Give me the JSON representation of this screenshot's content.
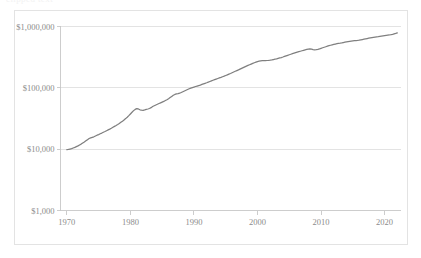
{
  "top_remnant_text": "clipped text",
  "chart_data": {
    "type": "line",
    "title": "",
    "subtitle": "",
    "xlabel": "",
    "ylabel": "",
    "yscale": "log",
    "ylim": [
      1000,
      1000000
    ],
    "xlim": [
      1969,
      2022.5
    ],
    "grid": true,
    "legend": false,
    "line_color": "#7f7f7f",
    "gridline_color": "#dcdcdc",
    "axis_color": "#c8c8c8",
    "text_color": "#8c8c8c",
    "background_color": "#ffffff",
    "y_tick_labels": [
      "$1,000,000",
      "$100,000",
      "$10,000",
      "$1,000"
    ],
    "y_tick_values": [
      1000000,
      100000,
      10000,
      1000
    ],
    "x_tick_labels": [
      "1970",
      "1980",
      "1990",
      "2000",
      "2010",
      "2020"
    ],
    "x_tick_values": [
      1970,
      1980,
      1990,
      2000,
      2010,
      2020
    ],
    "series": [
      {
        "name": "value",
        "x": [
          1970.0,
          1970.25,
          1970.5,
          1970.75,
          1971.0,
          1971.25,
          1971.5,
          1971.75,
          1972.0,
          1972.25,
          1972.5,
          1972.75,
          1973.0,
          1973.25,
          1973.5,
          1973.75,
          1974.0,
          1974.25,
          1974.5,
          1974.75,
          1975.0,
          1975.25,
          1975.5,
          1975.75,
          1976.0,
          1976.25,
          1976.5,
          1976.75,
          1977.0,
          1977.25,
          1977.5,
          1977.75,
          1978.0,
          1978.25,
          1978.5,
          1978.75,
          1979.0,
          1979.25,
          1979.5,
          1979.75,
          1980.0,
          1980.25,
          1980.5,
          1980.75,
          1981.0,
          1981.25,
          1981.5,
          1981.75,
          1982.0,
          1982.25,
          1982.5,
          1982.75,
          1983.0,
          1983.25,
          1983.5,
          1983.75,
          1984.0,
          1984.25,
          1984.5,
          1984.75,
          1985.0,
          1985.25,
          1985.5,
          1985.75,
          1986.0,
          1986.25,
          1986.5,
          1986.75,
          1987.0,
          1987.25,
          1987.5,
          1987.75,
          1988.0,
          1988.25,
          1988.5,
          1988.75,
          1989.0,
          1989.25,
          1989.5,
          1989.75,
          1990.0,
          1990.25,
          1990.5,
          1990.75,
          1991.0,
          1991.25,
          1991.5,
          1991.75,
          1992.0,
          1992.25,
          1992.5,
          1992.75,
          1993.0,
          1993.25,
          1993.5,
          1993.75,
          1994.0,
          1994.25,
          1994.5,
          1994.75,
          1995.0,
          1995.25,
          1995.5,
          1995.75,
          1996.0,
          1996.25,
          1996.5,
          1996.75,
          1997.0,
          1997.25,
          1997.5,
          1997.75,
          1998.0,
          1998.25,
          1998.5,
          1998.75,
          1999.0,
          1999.25,
          1999.5,
          1999.75,
          2000.0,
          2000.25,
          2000.5,
          2000.75,
          2001.0,
          2001.25,
          2001.5,
          2001.75,
          2002.0,
          2002.25,
          2002.5,
          2002.75,
          2003.0,
          2003.25,
          2003.5,
          2003.75,
          2004.0,
          2004.25,
          2004.5,
          2004.75,
          2005.0,
          2005.25,
          2005.5,
          2005.75,
          2006.0,
          2006.25,
          2006.5,
          2006.75,
          2007.0,
          2007.25,
          2007.5,
          2007.75,
          2008.0,
          2008.25,
          2008.5,
          2008.75,
          2009.0,
          2009.25,
          2009.5,
          2009.75,
          2010.0,
          2010.25,
          2010.5,
          2010.75,
          2011.0,
          2011.25,
          2011.5,
          2011.75,
          2012.0,
          2012.25,
          2012.5,
          2012.75,
          2013.0,
          2013.25,
          2013.5,
          2013.75,
          2014.0,
          2014.25,
          2014.5,
          2014.75,
          2015.0,
          2015.25,
          2015.5,
          2015.75,
          2016.0,
          2016.25,
          2016.5,
          2016.75,
          2017.0,
          2017.25,
          2017.5,
          2017.75,
          2018.0,
          2018.25,
          2018.5,
          2018.75,
          2019.0,
          2019.25,
          2019.5,
          2019.75,
          2020.0,
          2020.25,
          2020.5,
          2020.75,
          2021.0,
          2021.25,
          2021.5,
          2021.75,
          2022.0
        ],
        "values": [
          9800,
          9900,
          10050,
          10200,
          10450,
          10700,
          11000,
          11300,
          11700,
          12100,
          12600,
          13100,
          13700,
          14300,
          14900,
          15300,
          15600,
          15900,
          16400,
          16900,
          17300,
          17800,
          18300,
          18900,
          19400,
          20000,
          20600,
          21200,
          21900,
          22700,
          23500,
          24300,
          25200,
          26200,
          27400,
          28600,
          30000,
          31500,
          33200,
          35200,
          37500,
          40000,
          42500,
          44500,
          45800,
          45200,
          43800,
          43200,
          43000,
          43600,
          44500,
          45200,
          46000,
          47500,
          49500,
          51000,
          52500,
          54000,
          55500,
          57000,
          58500,
          60000,
          62000,
          64000,
          66500,
          69500,
          72500,
          75500,
          78000,
          79500,
          80500,
          82000,
          84000,
          86500,
          89000,
          91500,
          94000,
          96500,
          99000,
          101000,
          103000,
          105000,
          107000,
          109000,
          111000,
          113500,
          116000,
          118500,
          121000,
          124000,
          127000,
          130000,
          133000,
          136000,
          139000,
          142000,
          145000,
          148000,
          151500,
          155000,
          159000,
          163000,
          167000,
          171000,
          176000,
          181000,
          186000,
          191000,
          196000,
          202000,
          208000,
          214000,
          220000,
          226000,
          232000,
          238000,
          244000,
          250000,
          256000,
          262000,
          268000,
          272000,
          275000,
          277000,
          278000,
          278500,
          279000,
          280000,
          282000,
          285000,
          289000,
          293000,
          297000,
          302000,
          307000,
          312000,
          318000,
          325000,
          332000,
          339000,
          346000,
          353000,
          360000,
          367000,
          374000,
          381000,
          388000,
          395000,
          402000,
          409000,
          416000,
          422000,
          427000,
          430000,
          428000,
          421000,
          416000,
          418000,
          424000,
          432000,
          441000,
          450000,
          459000,
          468000,
          477000,
          486000,
          495000,
          503000,
          511000,
          518000,
          524000,
          529000,
          534000,
          540000,
          547000,
          554000,
          561000,
          568000,
          574000,
          579000,
          583000,
          587000,
          591000,
          595000,
          600000,
          606000,
          613000,
          620000,
          628000,
          636000,
          644000,
          652000,
          660000,
          667000,
          673000,
          678000,
          683000,
          689000,
          696000,
          703000,
          710000,
          716000,
          721000,
          727000,
          735000,
          745000,
          757000,
          770000,
          785000
        ]
      }
    ]
  }
}
